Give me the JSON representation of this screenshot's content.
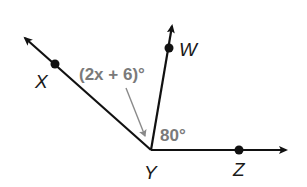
{
  "diagram": {
    "type": "angles",
    "vertex": {
      "label": "Y"
    },
    "points": [
      {
        "label": "X"
      },
      {
        "label": "W"
      },
      {
        "label": "Z"
      }
    ],
    "angles": [
      {
        "name": "angle-XYW",
        "label": "(2x + 6)°"
      },
      {
        "name": "angle-WYZ",
        "label": "80°"
      }
    ],
    "colors": {
      "lines": "#111111",
      "angle_labels": "#7a7a7a",
      "pointer_arrow": "#8a8a8a"
    }
  }
}
